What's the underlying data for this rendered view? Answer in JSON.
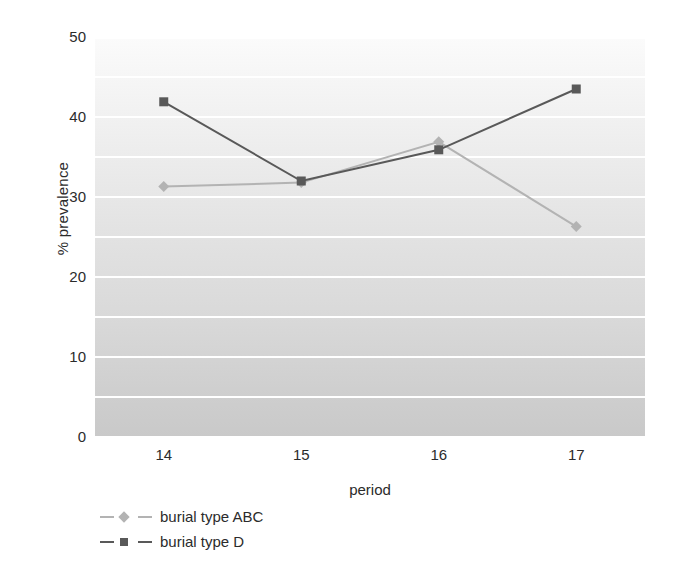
{
  "chart_data": {
    "type": "line",
    "title": "",
    "xlabel": "period",
    "ylabel": "% prevalence",
    "categories": [
      "14",
      "15",
      "16",
      "17"
    ],
    "x": [
      14,
      15,
      16,
      17
    ],
    "ylim": [
      0,
      50
    ],
    "ytick_step": 10,
    "yticks": [
      "50",
      "40",
      "30",
      "20",
      "10",
      "0"
    ],
    "ytick_values": [
      50,
      40,
      30,
      20,
      10,
      0
    ],
    "gridline_step": 5,
    "grid": true,
    "grid_color": "#ffffff",
    "legend_position": "bottom-left",
    "plot_background": "vertical gradient light-gray",
    "series": [
      {
        "name": "burial type ABC",
        "values": [
          31.3,
          31.8,
          36.9,
          26.3
        ],
        "color": "#b3b3b3",
        "marker": "diamond"
      },
      {
        "name": "burial type D",
        "values": [
          41.9,
          32.0,
          35.9,
          43.5
        ],
        "color": "#595959",
        "marker": "square"
      }
    ]
  },
  "legend": {
    "items": [
      {
        "label": "burial type ABC",
        "color": "#b3b3b3",
        "marker": "diamond"
      },
      {
        "label": "burial type D",
        "color": "#595959",
        "marker": "square"
      }
    ]
  },
  "axes": {
    "y_title": "% prevalence",
    "x_title": "period"
  }
}
